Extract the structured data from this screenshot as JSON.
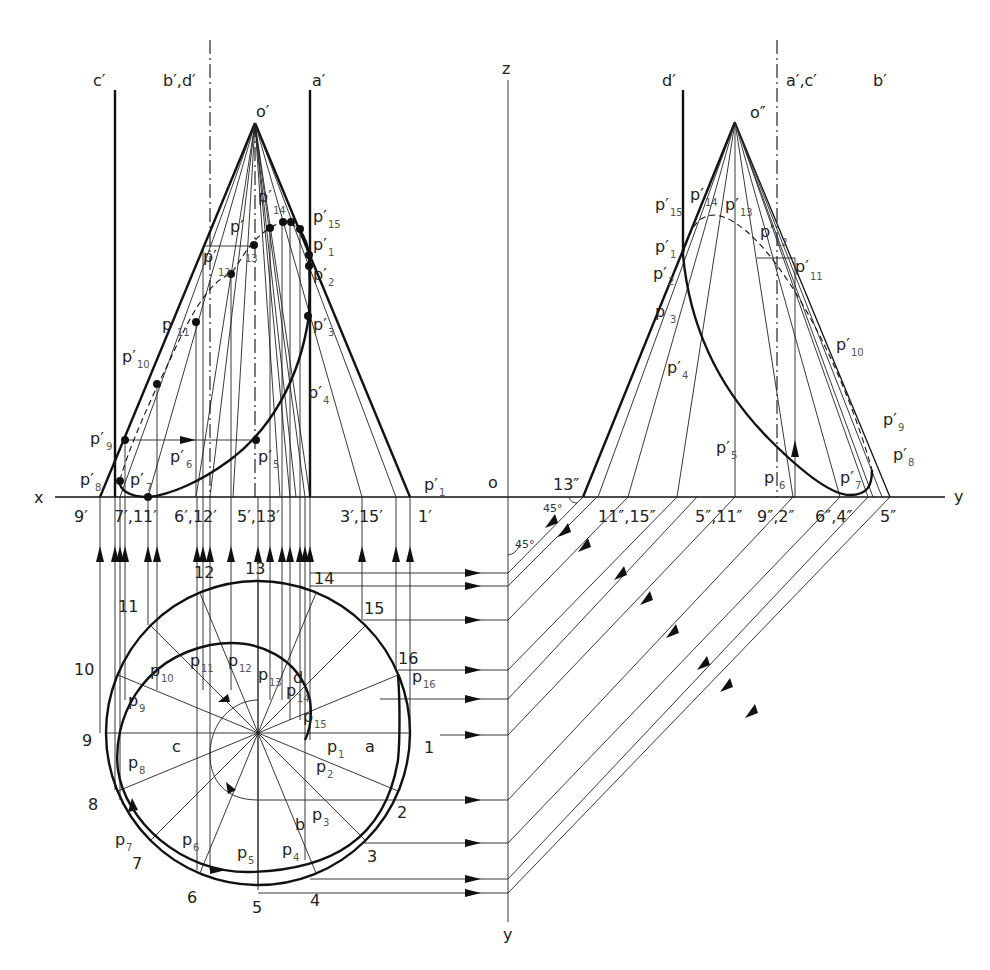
{
  "figure": {
    "axes": {
      "x_label": "x",
      "y_label_right": "y",
      "z_label": "z",
      "origin_label": "o",
      "y_label_bottom": "y",
      "angle_1": "45°",
      "angle_2": "45°"
    },
    "front_view": {
      "apex": "o′",
      "generator_lines": {
        "c": "c′",
        "bd": "b′,d′",
        "a": "a′"
      },
      "curve_points": [
        {
          "p": "p′",
          "s": "1"
        },
        {
          "p": "p′",
          "s": "2"
        },
        {
          "p": "p′",
          "s": "3"
        },
        {
          "p": "p′",
          "s": "4"
        },
        {
          "p": "p′",
          "s": "5"
        },
        {
          "p": "p′",
          "s": "6"
        },
        {
          "p": "p′",
          "s": "7"
        },
        {
          "p": "p′",
          "s": "8"
        },
        {
          "p": "p′",
          "s": "9"
        },
        {
          "p": "p′",
          "s": "10"
        },
        {
          "p": "p′",
          "s": "11"
        },
        {
          "p": "p′",
          "s": "12"
        },
        {
          "p": "p′",
          "s": "13"
        },
        {
          "p": "p′",
          "s": "14"
        },
        {
          "p": "p′",
          "s": "15"
        }
      ],
      "base_labels": [
        "9′",
        "7′,11′",
        "6′,12′",
        "5′,13′",
        "3′,15′",
        "1′"
      ],
      "p1_axis_label": {
        "p": "p′",
        "s": "1"
      }
    },
    "side_view": {
      "apex": "o″",
      "generator_lines": {
        "d": "d′",
        "ac": "a′,c′",
        "b": "b′"
      },
      "curve_points": [
        {
          "p": "p′",
          "s": "15"
        },
        {
          "p": "p′",
          "s": "14"
        },
        {
          "p": "p′",
          "s": "13"
        },
        {
          "p": "p′",
          "s": "12"
        },
        {
          "p": "p′",
          "s": "1"
        },
        {
          "p": "p′",
          "s": "2"
        },
        {
          "p": "p′",
          "s": "11"
        },
        {
          "p": "p",
          "s": "3"
        },
        {
          "p": "p′",
          "s": "10"
        },
        {
          "p": "p′",
          "s": "4"
        },
        {
          "p": "p′",
          "s": "5"
        },
        {
          "p": "p",
          "s": "6"
        },
        {
          "p": "p′",
          "s": "7"
        },
        {
          "p": "p′",
          "s": "9"
        },
        {
          "p": "p′",
          "s": "8"
        }
      ],
      "base_labels": [
        "13″",
        "11″,15″",
        "5″,11″",
        "9″,2″",
        "6″,4″",
        "5″"
      ]
    },
    "top_view": {
      "circle_divisions": [
        "1",
        "2",
        "3",
        "4",
        "5",
        "6",
        "7",
        "8",
        "9",
        "10",
        "11",
        "12",
        "13",
        "14",
        "15",
        "16"
      ],
      "spiral_points": [
        {
          "p": "p",
          "s": "1"
        },
        {
          "p": "p",
          "s": "2"
        },
        {
          "p": "p",
          "s": "3"
        },
        {
          "p": "p",
          "s": "4"
        },
        {
          "p": "p",
          "s": "5"
        },
        {
          "p": "p",
          "s": "6"
        },
        {
          "p": "p",
          "s": "7"
        },
        {
          "p": "p",
          "s": "8"
        },
        {
          "p": "p",
          "s": "9"
        },
        {
          "p": "p",
          "s": "10"
        },
        {
          "p": "p",
          "s": "11"
        },
        {
          "p": "p",
          "s": "12"
        },
        {
          "p": "p",
          "s": "13"
        },
        {
          "p": "p",
          "s": "14"
        },
        {
          "p": "p",
          "s": "15"
        },
        {
          "p": "p",
          "s": "16"
        }
      ],
      "quadrant_labels": {
        "a": "a",
        "b": "b",
        "c": "c",
        "d": "d"
      }
    }
  }
}
